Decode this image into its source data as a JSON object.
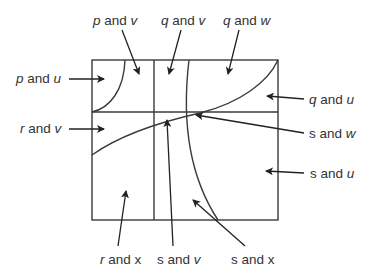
{
  "diagram": {
    "colors": {
      "line": "#3a3a3a",
      "text": "#333333",
      "background": "#ffffff"
    },
    "box": {
      "x": 92,
      "y": 60,
      "width": 186,
      "height": 160
    },
    "labels": [
      {
        "id": "p-and-v",
        "var1": "p",
        "var1_italic": true,
        "conj": " and ",
        "var2": "v",
        "var2_italic": true
      },
      {
        "id": "q-and-v",
        "var1": "q",
        "var1_italic": true,
        "conj": " and ",
        "var2": "v",
        "var2_italic": true
      },
      {
        "id": "q-and-w",
        "var1": "q",
        "var1_italic": true,
        "conj": " and ",
        "var2": "w",
        "var2_italic": true
      },
      {
        "id": "p-and-u",
        "var1": "p",
        "var1_italic": true,
        "conj": " and ",
        "var2": "u",
        "var2_italic": true
      },
      {
        "id": "q-and-u",
        "var1": "q",
        "var1_italic": true,
        "conj": " and ",
        "var2": "u",
        "var2_italic": true
      },
      {
        "id": "r-and-v",
        "var1": "r",
        "var1_italic": true,
        "conj": " and ",
        "var2": "v",
        "var2_italic": true
      },
      {
        "id": "s-and-w",
        "var1": "s",
        "var1_italic": false,
        "conj": " and ",
        "var2": "w",
        "var2_italic": true
      },
      {
        "id": "s-and-u",
        "var1": "s",
        "var1_italic": false,
        "conj": " and ",
        "var2": "u",
        "var2_italic": true
      },
      {
        "id": "r-and-x",
        "var1": "r",
        "var1_italic": true,
        "conj": " and ",
        "var2": "x",
        "var2_italic": false
      },
      {
        "id": "s-and-v",
        "var1": "s",
        "var1_italic": false,
        "conj": " and ",
        "var2": "v",
        "var2_italic": true
      },
      {
        "id": "s-and-x",
        "var1": "s",
        "var1_italic": false,
        "conj": " and ",
        "var2": "x",
        "var2_italic": false
      }
    ]
  }
}
